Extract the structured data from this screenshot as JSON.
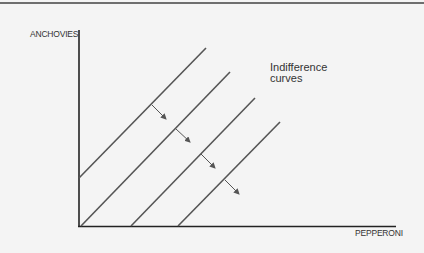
{
  "diagram": {
    "type": "indifference-curves",
    "y_axis_label": "ANCHOVIES",
    "x_axis_label": "PEPPERONI",
    "annotation": {
      "line1": "Indifference",
      "line2": "curves"
    },
    "curve_count": 4,
    "curve_shape": "parallel straight lines with positive slope",
    "arrows": "point down-right, indicating direction of increasing preference",
    "colors": {
      "background": "#f4f4f4",
      "axes": "#222222",
      "curves": "#555555",
      "arrows": "#555555",
      "top_rule": "#6e6e6e"
    }
  }
}
